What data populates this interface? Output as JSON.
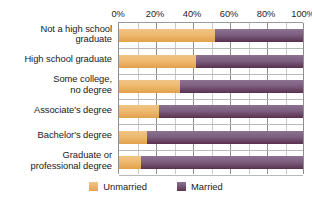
{
  "chart_data": {
    "type": "bar",
    "subtype": "stacked-horizontal-100-percent",
    "title": "",
    "subtitle": "",
    "xlabel": "",
    "ylabel": "",
    "xlim": [
      0,
      100
    ],
    "xticks": [
      "0%",
      "20%",
      "40%",
      "60%",
      "80%",
      "100%"
    ],
    "xtick_values": [
      0,
      20,
      40,
      60,
      80,
      100
    ],
    "grid": true,
    "grid_minor_step": 10,
    "legend_position": "bottom",
    "orientation": "horizontal",
    "categories": [
      "Not a high school graduate",
      "High school graduate",
      "Some college, no degree",
      "Associate's degree",
      "Bachelor's degree",
      "Graduate or professional degree"
    ],
    "category_lines": [
      [
        "Not a high school",
        "graduate"
      ],
      [
        "High school graduate"
      ],
      [
        "Some college,",
        "no degree"
      ],
      [
        "Associate's degree"
      ],
      [
        "Bachelor's degree"
      ],
      [
        "Graduate or",
        "professional degree"
      ]
    ],
    "series": [
      {
        "name": "Unmarried",
        "color": "#e8b169",
        "values": [
          52,
          42,
          33,
          22,
          15,
          12
        ]
      },
      {
        "name": "Married",
        "color": "#6d4a68",
        "values": [
          48,
          58,
          67,
          78,
          85,
          88
        ]
      }
    ]
  },
  "legend": {
    "items": [
      {
        "label": "Unmarried",
        "swatch": "unmarried-swatch"
      },
      {
        "label": "Married",
        "swatch": "married-swatch"
      }
    ]
  },
  "colors": {
    "unmarried": "#e8b169",
    "married": "#6d4a68",
    "axis": "#8e8e8e",
    "grid": "#c9c9c9",
    "text": "#1a1a1a",
    "background": "#ffffff"
  }
}
